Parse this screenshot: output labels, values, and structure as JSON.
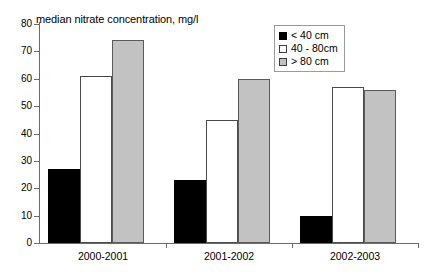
{
  "chart_data": {
    "type": "bar",
    "title": "median nitrate concentration, mg/l",
    "xlabel": "",
    "ylabel": "",
    "ylim": [
      0,
      80
    ],
    "ytick_labels": [
      "0",
      "10",
      "20",
      "30",
      "40",
      "50",
      "60",
      "70",
      "80"
    ],
    "yticks": [
      0,
      10,
      20,
      30,
      40,
      50,
      60,
      70,
      80
    ],
    "grid": false,
    "legend_position": "top-right",
    "categories": [
      "2000-2001",
      "2001-2002",
      "2002-2003"
    ],
    "series": [
      {
        "name": "< 40 cm",
        "color": "#000000",
        "values": [
          27,
          23,
          10
        ]
      },
      {
        "name": "40 - 80cm",
        "color": "#ffffff",
        "values": [
          61,
          45,
          57
        ]
      },
      {
        "name": "> 80 cm",
        "color": "#c2c2c2",
        "values": [
          74,
          60,
          56
        ]
      }
    ]
  },
  "legend": {
    "items": [
      {
        "label": "< 40 cm"
      },
      {
        "label": "40 - 80cm"
      },
      {
        "label": "> 80 cm"
      }
    ]
  }
}
